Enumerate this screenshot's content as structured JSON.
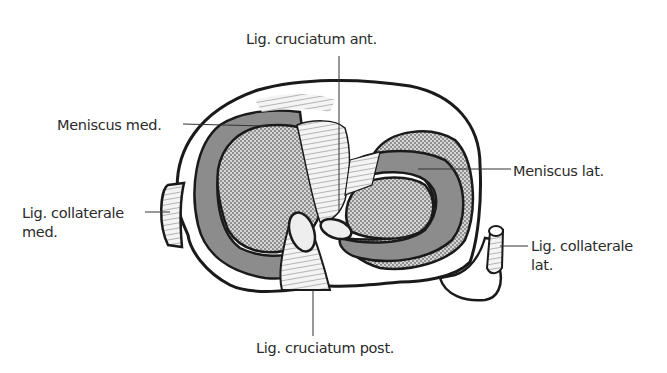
{
  "figure": {
    "colors": {
      "background": "#ffffff",
      "outline": "#1a1a1a",
      "meniscus_fill": "#8c8c8c",
      "cartilage_stipple": "#b5b5b5",
      "ligament_fill": "#f2f2f2",
      "label_text": "#2b2b2b"
    },
    "labels": {
      "acl": "Lig. cruciatum ant.",
      "meniscus_med": "Meniscus med.",
      "meniscus_lat": "Meniscus lat.",
      "collateral_med_line1": "Lig. collaterale",
      "collateral_med_line2": "med.",
      "collateral_lat_line1": "Lig. collaterale",
      "collateral_lat_line2": "lat.",
      "pcl": "Lig. cruciatum post."
    }
  }
}
